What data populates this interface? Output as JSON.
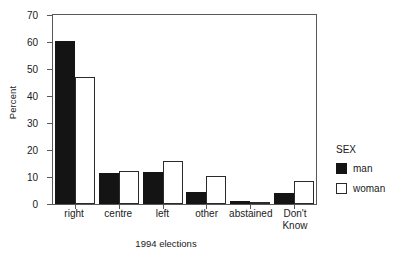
{
  "chart_data": {
    "type": "bar",
    "title": "",
    "subtitle": "",
    "xlabel": "1994 elections",
    "ylabel": "Percent",
    "categories": [
      "right",
      "centre",
      "left",
      "other",
      "abstained",
      "Don't\nKnow"
    ],
    "series": [
      {
        "name": "man",
        "color": "#141414",
        "fill": "solid",
        "values": [
          60.3,
          11.6,
          12.0,
          4.5,
          1.2,
          4.2
        ]
      },
      {
        "name": "woman",
        "color": "#ffffff",
        "fill": "outline",
        "values": [
          47.0,
          12.2,
          15.9,
          10.2,
          0.6,
          8.6
        ]
      }
    ],
    "ylim": [
      0,
      70
    ],
    "yticks": [
      0,
      10,
      20,
      30,
      40,
      50,
      60,
      70
    ],
    "ytick_labels": [
      "0",
      "10",
      "20",
      "30",
      "40",
      "50",
      "60",
      "70"
    ],
    "grid": false,
    "frame": true,
    "legend": {
      "title": "SEX",
      "position": "right",
      "entries": [
        {
          "label": "man",
          "swatch": "filled-black"
        },
        {
          "label": "woman",
          "swatch": "outlined-white"
        }
      ]
    }
  }
}
